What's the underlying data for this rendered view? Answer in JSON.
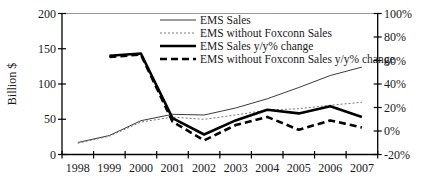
{
  "chart_data": {
    "type": "line",
    "title": "",
    "categories": [
      "1998",
      "1999",
      "2000",
      "2001",
      "2002",
      "2003",
      "2004",
      "2005",
      "2006",
      "2007"
    ],
    "left_axis": {
      "title": "Billion $",
      "min": 0,
      "max": 200,
      "ticks": [
        {
          "v": 0,
          "label": "0"
        },
        {
          "v": 50,
          "label": "50"
        },
        {
          "v": 100,
          "label": "100"
        },
        {
          "v": 150,
          "label": "150"
        },
        {
          "v": 200,
          "label": "200"
        }
      ]
    },
    "right_axis": {
      "min": -20,
      "max": 100,
      "ticks": [
        {
          "v": -20,
          "label": "-20%"
        },
        {
          "v": 0,
          "label": "0%"
        },
        {
          "v": 20,
          "label": "20%"
        },
        {
          "v": 40,
          "label": "40%"
        },
        {
          "v": 60,
          "label": "60%"
        },
        {
          "v": 80,
          "label": "80%"
        },
        {
          "v": 100,
          "label": "100%"
        }
      ]
    },
    "legend_position": "top-center",
    "grid": false,
    "colors": {
      "thin_solid": "#3a3a3a",
      "thin_dotted": "#787878",
      "thick": "#000000",
      "plot_top_border": "#999999",
      "axis": "#000000"
    },
    "series": [
      {
        "name": "EMS Sales",
        "axis": "left",
        "style": "thin-solid",
        "values": [
          17,
          27,
          48,
          57,
          56,
          66,
          79,
          95,
          112,
          124
        ]
      },
      {
        "name": "EMS without Foxconn Sales",
        "axis": "left",
        "style": "thin-dotted",
        "values": [
          16,
          26,
          46,
          53,
          50,
          56,
          63,
          65,
          70,
          74
        ]
      },
      {
        "name": "EMS Sales y/y% change",
        "axis": "right",
        "style": "thick-solid",
        "values": [
          null,
          64,
          66,
          11,
          -3,
          9,
          18,
          15,
          21,
          12
        ]
      },
      {
        "name": "EMS without Foxconn Sales y/y% change",
        "axis": "right",
        "style": "thick-dashed",
        "values": [
          null,
          63,
          65,
          8,
          -8,
          5,
          12,
          1,
          9,
          3
        ]
      }
    ]
  }
}
